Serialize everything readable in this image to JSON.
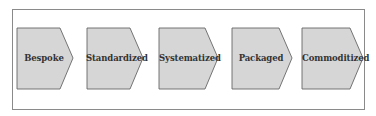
{
  "diagram": {
    "type": "process-flow",
    "direction": "left-to-right",
    "colors": {
      "shape_fill": "#d6d6d6",
      "shape_stroke": "#666666",
      "frame_stroke": "#8a8a8a",
      "text": "#333333",
      "background": "#ffffff"
    },
    "steps": [
      {
        "label": "Bespoke"
      },
      {
        "label": "Standardized"
      },
      {
        "label": "Systematized"
      },
      {
        "label": "Packaged"
      },
      {
        "label": "Commoditized"
      }
    ]
  }
}
